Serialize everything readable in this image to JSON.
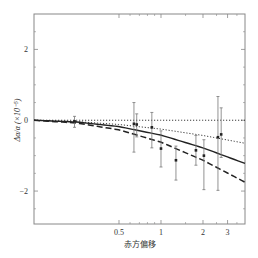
{
  "chart_data": {
    "type": "scatter",
    "title": "",
    "xlabel": "赤方偏移",
    "ylabel": "Δα/α (×10⁻⁵)",
    "xscale": "log",
    "xlim": [
      0.123,
      4.0
    ],
    "ylim": [
      -2.93,
      3.0
    ],
    "grid": false,
    "legend": null,
    "x_ticks": [
      {
        "value": 0.5,
        "label": "0.5"
      },
      {
        "value": 1,
        "label": "1"
      },
      {
        "value": 2,
        "label": "2"
      },
      {
        "value": 3,
        "label": "3"
      }
    ],
    "x_minor_ticks": [
      0.6,
      0.7,
      0.8,
      0.9,
      1.5,
      2.5,
      3.5
    ],
    "y_ticks": [
      {
        "value": 2,
        "label": "2"
      },
      {
        "value": 0,
        "label": "0"
      },
      {
        "value": -2,
        "label": "−2"
      }
    ],
    "y_minor_ticks": [
      -2.5,
      -1.5,
      -1,
      -0.5,
      0.5,
      1,
      1.5,
      2.5
    ],
    "points": [
      {
        "x": 0.24,
        "y": -0.03,
        "err_up": 0.14,
        "err_down": 0.17
      },
      {
        "x": 0.64,
        "y": -0.1,
        "err_up": 0.6,
        "err_down": 0.8
      },
      {
        "x": 0.67,
        "y": -0.12,
        "err_up": 0.3,
        "err_down": 0.35
      },
      {
        "x": 0.86,
        "y": -0.2,
        "err_up": 0.42,
        "err_down": 0.58
      },
      {
        "x": 1.0,
        "y": -0.8,
        "err_up": 0.5,
        "err_down": 0.52
      },
      {
        "x": 1.28,
        "y": -1.13,
        "err_up": 0.4,
        "err_down": 0.56
      },
      {
        "x": 1.78,
        "y": -0.85,
        "err_up": 0.42,
        "err_down": 0.42
      },
      {
        "x": 2.03,
        "y": -1.0,
        "err_up": 0.45,
        "err_down": 0.96
      },
      {
        "x": 2.56,
        "y": -0.48,
        "err_up": 1.15,
        "err_down": 1.5
      },
      {
        "x": 2.7,
        "y": -0.4,
        "err_up": 0.75,
        "err_down": 0.65
      }
    ],
    "series": [
      {
        "name": "zero-line",
        "style": "dotted",
        "x": [
          0.123,
          4.0
        ],
        "y": [
          0,
          0
        ]
      },
      {
        "name": "model-dotted",
        "style": "dotted",
        "x": [
          0.123,
          0.25,
          0.5,
          1.0,
          2.0,
          4.0
        ],
        "y": [
          0,
          -0.04,
          -0.12,
          -0.25,
          -0.43,
          -0.65
        ]
      },
      {
        "name": "model-solid",
        "style": "solid",
        "x": [
          0.123,
          0.25,
          0.5,
          1.0,
          2.0,
          4.0
        ],
        "y": [
          0,
          -0.05,
          -0.18,
          -0.42,
          -0.78,
          -1.22
        ]
      },
      {
        "name": "model-dashed",
        "style": "dashed",
        "x": [
          0.123,
          0.25,
          0.5,
          1.0,
          2.0,
          4.0
        ],
        "y": [
          0,
          -0.08,
          -0.27,
          -0.62,
          -1.13,
          -1.75
        ]
      }
    ]
  },
  "frame": {
    "left": 34,
    "top": 14,
    "right": 245,
    "bottom": 224
  },
  "colors": {
    "axis": "#888888",
    "line": "#222222",
    "errorbar": "#777777",
    "text": "#333333"
  }
}
